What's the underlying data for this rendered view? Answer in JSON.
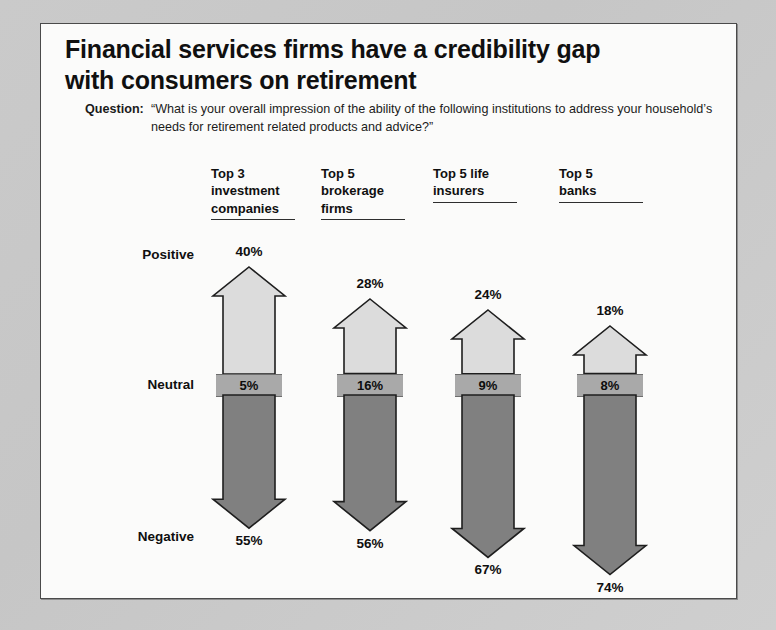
{
  "slide": {
    "title_lines": [
      "Financial services firms have a credibility gap",
      "with consumers on retirement"
    ],
    "question_label": "Question:",
    "question_text": "“What is your overall impression of the ability of the following institutions to address your household’s needs for retirement related products and advice?”"
  },
  "row_labels": {
    "positive": "Positive",
    "neutral": "Neutral",
    "negative": "Negative"
  },
  "colors": {
    "positive_fill": "#dcdcdc",
    "neutral_fill": "#a9a9a9",
    "negative_fill": "#808080",
    "outline": "#1e1e1e",
    "page_background": "#c9c9c9",
    "slide_background": "#fbfbfa",
    "text": "#101010"
  },
  "chart_data": {
    "type": "bar",
    "title": "Financial services firms have a credibility gap with consumers on retirement",
    "subtitle": "Question: “What is your overall impression of the ability of the following institutions to address your household’s needs for retirement related products and advice?”",
    "xlabel": "",
    "ylabel": "",
    "ylim": [
      0,
      100
    ],
    "grid": false,
    "legend": "none",
    "units": "percent",
    "categories": [
      "Top 3 investment companies",
      "Top 5 brokerage firms",
      "Top 5 life insurers",
      "Top 5 banks"
    ],
    "category_lines": [
      [
        "Top 3",
        "investment",
        "companies"
      ],
      [
        "Top 5",
        "brokerage",
        "firms"
      ],
      [
        "Top 5 life",
        "insurers"
      ],
      [
        "Top 5",
        "banks"
      ]
    ],
    "series": [
      {
        "name": "Positive",
        "values": [
          40,
          28,
          24,
          18
        ],
        "labels": [
          "40%",
          "28%",
          "24%",
          "18%"
        ]
      },
      {
        "name": "Neutral",
        "values": [
          5,
          16,
          9,
          8
        ],
        "labels": [
          "5%",
          "16%",
          "9%",
          "8%"
        ]
      },
      {
        "name": "Negative",
        "values": [
          55,
          56,
          67,
          74
        ],
        "labels": [
          "55%",
          "56%",
          "67%",
          "74%"
        ]
      }
    ]
  }
}
